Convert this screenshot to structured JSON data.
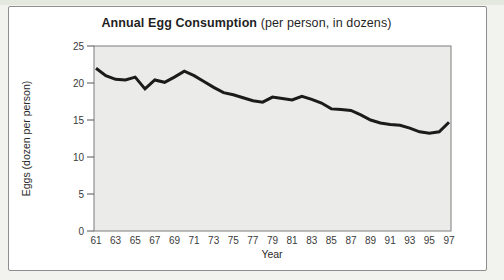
{
  "title": {
    "main": "Annual Egg Consumption",
    "suffix": " (per person, in dozens)"
  },
  "chart_data": {
    "type": "line",
    "title": "Annual Egg Consumption (per person, in dozens)",
    "xlabel": "Year",
    "ylabel": "Eggs (dozen per person)",
    "x": [
      61,
      62,
      63,
      64,
      65,
      66,
      67,
      68,
      69,
      70,
      71,
      72,
      73,
      74,
      75,
      76,
      77,
      78,
      79,
      80,
      81,
      82,
      83,
      84,
      85,
      86,
      87,
      88,
      89,
      90,
      91,
      92,
      93,
      94,
      95,
      96,
      97
    ],
    "x_tick_labels": [
      "61",
      "63",
      "65",
      "67",
      "69",
      "71",
      "73",
      "75",
      "77",
      "79",
      "81",
      "83",
      "85",
      "87",
      "89",
      "91",
      "93",
      "95",
      "97"
    ],
    "ylim": [
      0,
      25
    ],
    "yticks": [
      0,
      5,
      10,
      15,
      20,
      25
    ],
    "grid": false,
    "legend": "none",
    "series": [
      {
        "name": "Eggs (dozen per person)",
        "values": [
          22.0,
          21.0,
          20.5,
          20.4,
          20.8,
          19.2,
          20.4,
          20.1,
          20.8,
          21.6,
          21.0,
          20.2,
          19.4,
          18.7,
          18.4,
          18.0,
          17.6,
          17.4,
          18.1,
          17.9,
          17.7,
          18.2,
          17.8,
          17.3,
          16.5,
          16.4,
          16.3,
          15.7,
          15.0,
          14.6,
          14.4,
          14.3,
          13.9,
          13.4,
          13.2,
          13.4,
          14.7
        ]
      }
    ],
    "line_color": "#1b1b1b",
    "plot_bg": "#ebebe9",
    "plot_border": "#7d7d7d",
    "tick_color": "#555555"
  }
}
